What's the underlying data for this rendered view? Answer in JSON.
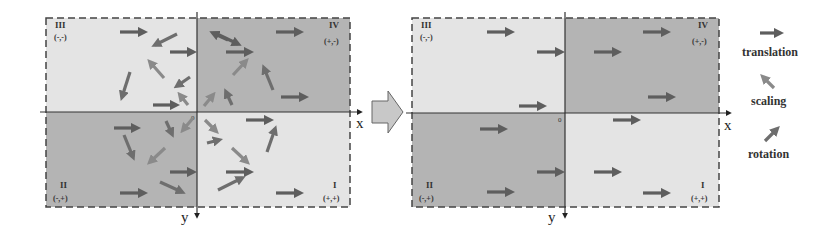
{
  "colors": {
    "light_quadrant": "#e4e4e4",
    "dark_quadrant": "#b4b4b4",
    "translation_arrow": "#5e5e5e",
    "scaling_arrow": "#8a8a8a",
    "rotation_arrow": "#6e6e6e",
    "axis": "#333333",
    "transition_arrow_fill": "#c8c8c8"
  },
  "left_panel": {
    "origin_label": "0",
    "x_axis_label": "x",
    "y_axis_label": "y",
    "quadrants": [
      {
        "name": "III",
        "sign": "(-,-)"
      },
      {
        "name": "IV",
        "sign": "(+,-)"
      },
      {
        "name": "II",
        "sign": "(-,+)"
      },
      {
        "name": "I",
        "sign": "(+,+)"
      }
    ],
    "arrows": [
      {
        "type": "translation",
        "x1": 120,
        "y1": 32,
        "x2": 144,
        "y2": 32
      },
      {
        "type": "rotation",
        "x1": 177,
        "y1": 34,
        "x2": 155,
        "y2": 45
      },
      {
        "type": "translation",
        "x1": 170,
        "y1": 52,
        "x2": 193,
        "y2": 52
      },
      {
        "type": "scaling",
        "x1": 164,
        "y1": 78,
        "x2": 150,
        "y2": 62
      },
      {
        "type": "rotation",
        "x1": 130,
        "y1": 72,
        "x2": 122,
        "y2": 97
      },
      {
        "type": "rotation",
        "x1": 190,
        "y1": 77,
        "x2": 177,
        "y2": 86
      },
      {
        "type": "translation",
        "x1": 153,
        "y1": 105,
        "x2": 176,
        "y2": 105
      },
      {
        "type": "scaling",
        "x1": 188,
        "y1": 105,
        "x2": 180,
        "y2": 95
      },
      {
        "type": "translation",
        "x1": 215,
        "y1": 33,
        "x2": 238,
        "y2": 44
      },
      {
        "type": "translation",
        "x1": 228,
        "y1": 40,
        "x2": 213,
        "y2": 33
      },
      {
        "type": "translation",
        "x1": 226,
        "y1": 52,
        "x2": 250,
        "y2": 52
      },
      {
        "type": "translation",
        "x1": 276,
        "y1": 32,
        "x2": 300,
        "y2": 32
      },
      {
        "type": "scaling",
        "x1": 233,
        "y1": 75,
        "x2": 246,
        "y2": 61
      },
      {
        "type": "rotation",
        "x1": 273,
        "y1": 90,
        "x2": 264,
        "y2": 68
      },
      {
        "type": "translation",
        "x1": 281,
        "y1": 97,
        "x2": 305,
        "y2": 97
      },
      {
        "type": "scaling",
        "x1": 204,
        "y1": 106,
        "x2": 213,
        "y2": 95
      },
      {
        "type": "rotation",
        "x1": 232,
        "y1": 105,
        "x2": 226,
        "y2": 92
      },
      {
        "type": "translation",
        "x1": 114,
        "y1": 128,
        "x2": 137,
        "y2": 128
      },
      {
        "type": "rotation",
        "x1": 124,
        "y1": 135,
        "x2": 133,
        "y2": 157
      },
      {
        "type": "rotation",
        "x1": 166,
        "y1": 121,
        "x2": 172,
        "y2": 134
      },
      {
        "type": "scaling",
        "x1": 193,
        "y1": 118,
        "x2": 183,
        "y2": 130
      },
      {
        "type": "scaling",
        "x1": 165,
        "y1": 148,
        "x2": 150,
        "y2": 162
      },
      {
        "type": "translation",
        "x1": 170,
        "y1": 172,
        "x2": 193,
        "y2": 172
      },
      {
        "type": "rotation",
        "x1": 160,
        "y1": 182,
        "x2": 182,
        "y2": 192
      },
      {
        "type": "translation",
        "x1": 120,
        "y1": 193,
        "x2": 144,
        "y2": 193
      },
      {
        "type": "translation",
        "x1": 246,
        "y1": 120,
        "x2": 270,
        "y2": 120
      },
      {
        "type": "scaling",
        "x1": 205,
        "y1": 120,
        "x2": 216,
        "y2": 131
      },
      {
        "type": "rotation",
        "x1": 207,
        "y1": 143,
        "x2": 219,
        "y2": 140
      },
      {
        "type": "rotation",
        "x1": 267,
        "y1": 152,
        "x2": 275,
        "y2": 129
      },
      {
        "type": "scaling",
        "x1": 232,
        "y1": 148,
        "x2": 247,
        "y2": 162
      },
      {
        "type": "translation",
        "x1": 226,
        "y1": 172,
        "x2": 250,
        "y2": 172
      },
      {
        "type": "rotation",
        "x1": 218,
        "y1": 190,
        "x2": 242,
        "y2": 178
      },
      {
        "type": "translation",
        "x1": 276,
        "y1": 193,
        "x2": 300,
        "y2": 193
      }
    ]
  },
  "right_panel": {
    "origin_label": "0",
    "x_axis_label": "x",
    "y_axis_label": "y",
    "quadrants": [
      {
        "name": "III",
        "sign": "(-,-)"
      },
      {
        "name": "IV",
        "sign": "(+,-)"
      },
      {
        "name": "II",
        "sign": "(-,+)"
      },
      {
        "name": "I",
        "sign": "(+,+)"
      }
    ],
    "arrows": [
      {
        "type": "translation",
        "x1": 487,
        "y1": 32,
        "x2": 511,
        "y2": 32
      },
      {
        "type": "translation",
        "x1": 537,
        "y1": 52,
        "x2": 561,
        "y2": 52
      },
      {
        "type": "translation",
        "x1": 519,
        "y1": 106,
        "x2": 543,
        "y2": 106
      },
      {
        "type": "translation",
        "x1": 643,
        "y1": 32,
        "x2": 667,
        "y2": 32
      },
      {
        "type": "translation",
        "x1": 594,
        "y1": 52,
        "x2": 618,
        "y2": 52
      },
      {
        "type": "translation",
        "x1": 648,
        "y1": 97,
        "x2": 672,
        "y2": 97
      },
      {
        "type": "translation",
        "x1": 480,
        "y1": 129,
        "x2": 504,
        "y2": 129
      },
      {
        "type": "translation",
        "x1": 613,
        "y1": 120,
        "x2": 637,
        "y2": 120
      },
      {
        "type": "translation",
        "x1": 537,
        "y1": 172,
        "x2": 561,
        "y2": 172
      },
      {
        "type": "translation",
        "x1": 594,
        "y1": 172,
        "x2": 618,
        "y2": 172
      },
      {
        "type": "translation",
        "x1": 487,
        "y1": 192,
        "x2": 511,
        "y2": 192
      },
      {
        "type": "translation",
        "x1": 643,
        "y1": 193,
        "x2": 667,
        "y2": 193
      }
    ]
  },
  "legend": {
    "items": [
      {
        "type": "translation",
        "label": "translation"
      },
      {
        "type": "scaling",
        "label": "scaling"
      },
      {
        "type": "rotation",
        "label": "rotation"
      }
    ]
  }
}
